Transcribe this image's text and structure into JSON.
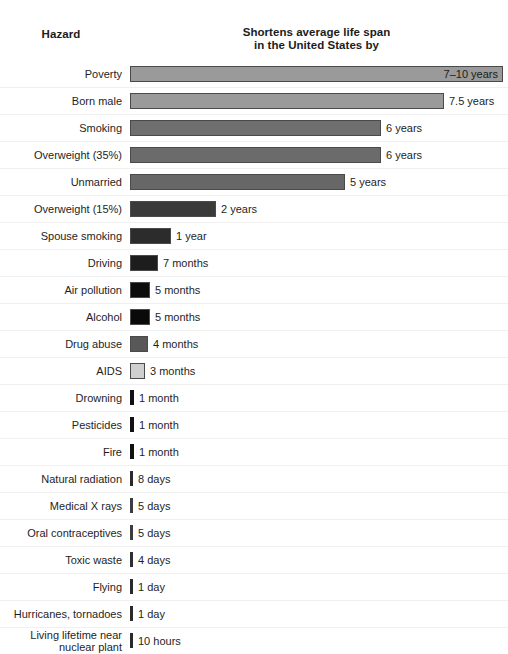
{
  "header": {
    "hazard_title": "Hazard",
    "value_title_line1": "Shortens average life span",
    "value_title_line2": "in the United States by"
  },
  "chart_data": {
    "type": "bar",
    "title": "Shortens average life span in the United States by",
    "xlabel": "",
    "ylabel": "Hazard",
    "orientation": "horizontal",
    "grid": false,
    "legend": false,
    "unit_note": "values shown as printed labels (years / months / days / hours)",
    "categories": [
      "Poverty",
      "Born male",
      "Smoking",
      "Overweight (35%)",
      "Unmarried",
      "Overweight (15%)",
      "Spouse smoking",
      "Driving",
      "Air pollution",
      "Alcohol",
      "Drug abuse",
      "AIDS",
      "Drowning",
      "Pesticides",
      "Fire",
      "Natural radiation",
      "Medical X rays",
      "Oral contraceptives",
      "Toxic waste",
      "Flying",
      "Hurricanes, tornadoes",
      "Living lifetime near nuclear plant"
    ],
    "value_labels": [
      "7–10 years",
      "7.5 years",
      "6 years",
      "6 years",
      "5 years",
      "2 years",
      "1 year",
      "7 months",
      "5 months",
      "5 months",
      "4 months",
      "3 months",
      "1 month",
      "1 month",
      "1 month",
      "8 days",
      "5 days",
      "5 days",
      "4 days",
      "1 day",
      "1 day",
      "10 hours"
    ],
    "values_days": [
      3105,
      2738,
      2190,
      2190,
      1825,
      730,
      365,
      213,
      152,
      152,
      122,
      91,
      30,
      30,
      30,
      8,
      5,
      5,
      4,
      1,
      1,
      0.42
    ]
  },
  "rows": [
    {
      "label": "Poverty",
      "label2": "",
      "value": "7–10 years",
      "barpx": 373,
      "color": "#9a9a9a",
      "inside": true,
      "sep": false
    },
    {
      "label": "Born male",
      "label2": "",
      "value": "7.5 years",
      "barpx": 314,
      "color": "#9a9a9a",
      "inside": false,
      "sep": true
    },
    {
      "label": "Smoking",
      "label2": "",
      "value": "6 years",
      "barpx": 251,
      "color": "#6f6f6f",
      "inside": false,
      "sep": true
    },
    {
      "label": "Overweight (35%)",
      "label2": "",
      "value": "6 years",
      "barpx": 251,
      "color": "#6b6b6b",
      "inside": false,
      "sep": true
    },
    {
      "label": "Unmarried",
      "label2": "",
      "value": "5 years",
      "barpx": 215,
      "color": "#676767",
      "inside": false,
      "sep": true
    },
    {
      "label": "Overweight (15%)",
      "label2": "",
      "value": "2 years",
      "barpx": 86,
      "color": "#3a3a3a",
      "inside": false,
      "sep": true
    },
    {
      "label": "Spouse smoking",
      "label2": "",
      "value": "1 year",
      "barpx": 41,
      "color": "#2c2c2c",
      "inside": false,
      "sep": true
    },
    {
      "label": "Driving",
      "label2": "",
      "value": "7 months",
      "barpx": 28,
      "color": "#1d1d1d",
      "inside": false,
      "sep": true
    },
    {
      "label": "Air pollution",
      "label2": "",
      "value": "5 months",
      "barpx": 20,
      "color": "#0d0d0d",
      "inside": false,
      "sep": true
    },
    {
      "label": "Alcohol",
      "label2": "",
      "value": "5 months",
      "barpx": 20,
      "color": "#0a0a0a",
      "inside": false,
      "sep": true
    },
    {
      "label": "Drug abuse",
      "label2": "",
      "value": "4 months",
      "barpx": 18,
      "color": "#585858",
      "inside": false,
      "sep": true
    },
    {
      "label": "AIDS",
      "label2": "",
      "value": "3 months",
      "barpx": 15,
      "color": "#cfcfcf",
      "inside": false,
      "sep": true
    },
    {
      "label": "Drowning",
      "label2": "",
      "value": "1 month",
      "barpx": 4,
      "color": "#111111",
      "inside": false,
      "sep": true
    },
    {
      "label": "Pesticides",
      "label2": "",
      "value": "1 month",
      "barpx": 4,
      "color": "#111111",
      "inside": false,
      "sep": true
    },
    {
      "label": "Fire",
      "label2": "",
      "value": "1 month",
      "barpx": 4,
      "color": "#111111",
      "inside": false,
      "sep": true
    },
    {
      "label": "Natural radiation",
      "label2": "",
      "value": "8 days",
      "barpx": 3,
      "color": "#2a2a2a",
      "inside": false,
      "sep": true
    },
    {
      "label": "Medical X rays",
      "label2": "",
      "value": "5 days",
      "barpx": 3,
      "color": "#3d3d3d",
      "inside": false,
      "sep": true
    },
    {
      "label": "Oral contraceptives",
      "label2": "",
      "value": "5 days",
      "barpx": 3,
      "color": "#3d3d3d",
      "inside": false,
      "sep": true
    },
    {
      "label": "Toxic waste",
      "label2": "",
      "value": "4 days",
      "barpx": 3,
      "color": "#2f2f2f",
      "inside": false,
      "sep": true
    },
    {
      "label": "Flying",
      "label2": "",
      "value": "1 day",
      "barpx": 3,
      "color": "#2a2a2a",
      "inside": false,
      "sep": true
    },
    {
      "label": "Hurricanes, tornadoes",
      "label2": "",
      "value": "1 day",
      "barpx": 3,
      "color": "#2a2a2a",
      "inside": false,
      "sep": true
    },
    {
      "label": "Living lifetime near",
      "label2": "nuclear plant",
      "value": "10 hours",
      "barpx": 3,
      "color": "#2a2a2a",
      "inside": false,
      "sep": true
    }
  ]
}
